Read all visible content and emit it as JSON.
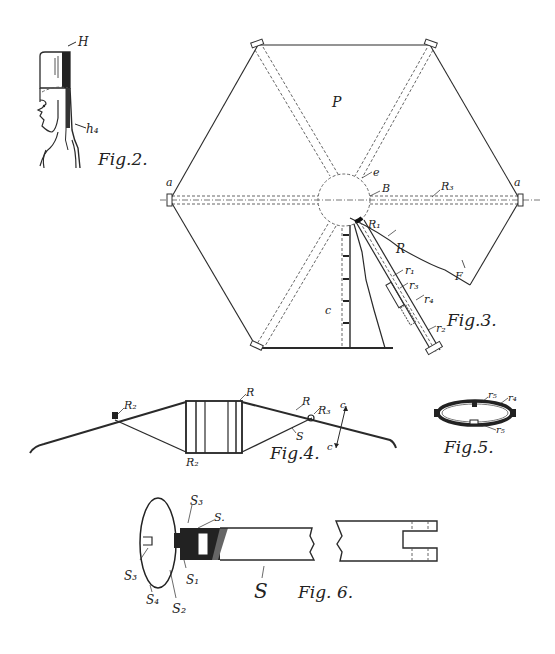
{
  "figures": {
    "fig2": {
      "caption": "Fig.2.",
      "labels": {
        "hat": "H",
        "strap": "h₄"
      }
    },
    "fig3": {
      "caption": "Fig.3.",
      "labels": {
        "panel": "P",
        "a_left": "a",
        "a_right": "a",
        "e": "e",
        "B": "B",
        "R_right": "R₃",
        "R_hub": "R₁",
        "R": "R",
        "r1": "r₁",
        "r3": "r₃",
        "r4": "r₄",
        "r2": "r₂",
        "c": "c",
        "F": "F"
      }
    },
    "fig4": {
      "caption": "Fig.4.",
      "labels": {
        "R2_left": "R₂",
        "R_top": "R",
        "R_bottom": "R₂",
        "R_right": "R",
        "R3": "R₃",
        "S": "S",
        "c_top": "c",
        "c_bottom": "c"
      }
    },
    "fig5": {
      "caption": "Fig.5.",
      "labels": {
        "r5_top": "r₅",
        "r4": "r₄",
        "r5_bottom": "r₅"
      }
    },
    "fig6": {
      "caption": "Fig. 6.",
      "labels": {
        "s3_top": "S₃",
        "s": "S.",
        "s3_left": "S₃",
        "s1": "S₁",
        "s4": "S₄",
        "s2": "S₂",
        "S": "S"
      }
    }
  }
}
